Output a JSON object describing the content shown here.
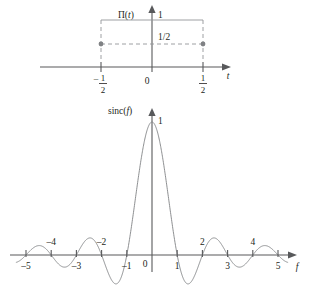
{
  "figure": {
    "background": "#ffffff",
    "curve_color": "#808285",
    "axis_color": "#58595b",
    "text_color": "#231f20"
  },
  "top_plot": {
    "name": "rect-function-plot",
    "function_label": "Π(",
    "function_var": "t",
    "function_label_close": ")",
    "y_top_label": "1",
    "mid_label": "1/2",
    "origin_label": "0",
    "x_axis_label": "t",
    "left_tick_num": "1",
    "left_tick_sign": "–",
    "left_tick_den": "2",
    "right_tick_num": "1",
    "right_tick_den": "2"
  },
  "bottom_plot": {
    "name": "sinc-function-plot",
    "function_label": "sinc(",
    "function_var": "f",
    "function_label_close": ")",
    "peak_label": "1",
    "origin_label": "0",
    "x_axis_label": "f",
    "ticks_below": [
      "–5",
      "–3",
      "–1",
      "1",
      "3",
      "5"
    ],
    "ticks_above": [
      "–4",
      "–2",
      "2",
      "4"
    ]
  },
  "chart_data": [
    {
      "type": "area",
      "title": "Π(t) — unit rectangular pulse",
      "xlabel": "t",
      "ylabel": "Π(t)",
      "xlim": [
        -1.05,
        1.05
      ],
      "ylim": [
        0,
        1.15
      ],
      "xticks": [
        -0.5,
        0,
        0.5
      ],
      "xticklabels": [
        "-1/2",
        "0",
        "1/2"
      ],
      "yticks": [
        0.5,
        1
      ],
      "yticklabels": [
        "1/2",
        "1"
      ],
      "grid": false,
      "legend": "none",
      "annotations": [
        "1/2"
      ],
      "markers": [
        {
          "x": -0.5,
          "y": 0.5
        },
        {
          "x": 0.5,
          "y": 0.5
        }
      ],
      "series": [
        {
          "name": "Π(t)",
          "style": "dashed-rectangle",
          "x": [
            -0.5,
            -0.5,
            0.5,
            0.5
          ],
          "values": [
            0,
            1,
            1,
            0
          ]
        },
        {
          "name": "half-level",
          "style": "dashed-horizontal",
          "x": [
            -0.5,
            0.5
          ],
          "values": [
            0.5,
            0.5
          ]
        }
      ]
    },
    {
      "type": "line",
      "title": "sinc(f) = sin(πf)/(πf)",
      "xlabel": "f",
      "ylabel": "sinc(f)",
      "xlim": [
        -5.4,
        5.4
      ],
      "ylim": [
        -0.3,
        1.08
      ],
      "xticks": [
        -5,
        -4,
        -3,
        -2,
        -1,
        0,
        1,
        2,
        3,
        4,
        5
      ],
      "xticklabels": [
        "-5",
        "-4",
        "-3",
        "-2",
        "-1",
        "0",
        "1",
        "2",
        "3",
        "4",
        "5"
      ],
      "yticks": [
        1
      ],
      "yticklabels": [
        "1"
      ],
      "grid": false,
      "legend": "none",
      "series": [
        {
          "name": "sinc(f)",
          "x": [
            -5,
            -4.5,
            -4,
            -3.5,
            -3,
            -2.5,
            -2,
            -1.5,
            -1,
            -0.5,
            0,
            0.5,
            1,
            1.5,
            2,
            2.5,
            3,
            3.5,
            4,
            4.5,
            5
          ],
          "values": [
            0,
            0.0707,
            0,
            -0.0909,
            0,
            0.1273,
            0,
            -0.2122,
            0,
            0.6366,
            1,
            0.6366,
            0,
            -0.2122,
            0,
            0.1273,
            0,
            -0.0909,
            0,
            0.0707,
            0
          ]
        }
      ]
    }
  ]
}
